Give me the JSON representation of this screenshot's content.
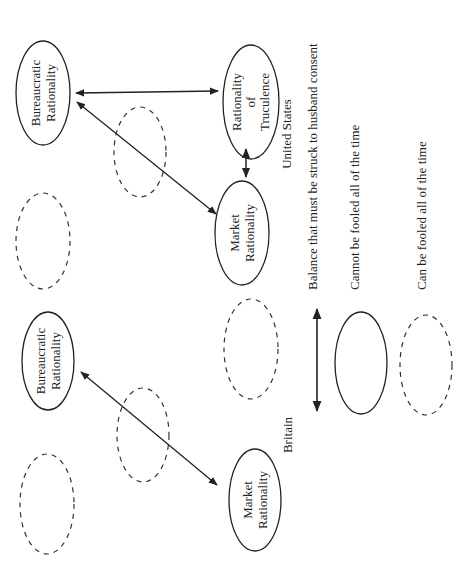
{
  "diagram": {
    "orientation": "rotated 90deg counter-clockwise",
    "colors": {
      "line": "#222222",
      "background": "#ffffff"
    },
    "panels": {
      "united_states": {
        "label": "United States",
        "nodes": {
          "bureaucratic": {
            "line1": "Bureaucratic",
            "line2": "Rationality",
            "style": "solid"
          },
          "truculence": {
            "line1": "Rationality",
            "line2": "of",
            "line3": "Truculence",
            "style": "solid"
          },
          "market": {
            "line1": "Market",
            "line2": "Rationality",
            "style": "solid"
          }
        },
        "dashed_ellipses": 2,
        "edges": [
          {
            "from": "Bureaucratic Rationality",
            "to": "Rationality of Truculence",
            "type": "double-arrow"
          },
          {
            "from": "Bureaucratic Rationality",
            "to": "Market Rationality",
            "type": "double-arrow"
          },
          {
            "from": "Market Rationality",
            "to": "Rationality of Truculence",
            "type": "double-arrow"
          }
        ]
      },
      "britain": {
        "label": "Britain",
        "nodes": {
          "bureaucratic": {
            "line1": "Bureaucratic",
            "line2": "Rationality",
            "style": "solid"
          },
          "market": {
            "line1": "Market",
            "line2": "Rationality",
            "style": "solid"
          }
        },
        "dashed_ellipses": 3,
        "edges": [
          {
            "from": "Bureaucratic Rationality",
            "to": "Market Rationality",
            "type": "double-arrow"
          }
        ]
      }
    },
    "legend": {
      "arrow_label": "Balance that must be struck to husband consent",
      "solid_label": "Cannot be fooled all of the time",
      "dashed_label": "Can be fooled all of the time"
    }
  }
}
